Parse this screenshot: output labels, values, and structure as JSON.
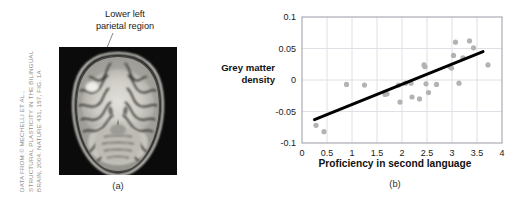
{
  "figure": {
    "panel_a": {
      "caption": "(a)",
      "callout_label_line1": "Lower left",
      "callout_label_line2": "parietal region",
      "image_description": "coronal-mri-brain-scan"
    },
    "panel_b": {
      "caption": "(b)"
    },
    "credit": {
      "line1": "DATA FROM © MECHELLI ET AL.,",
      "line2": "STRUCTURAL PLASTICITY IN THE BILINGUAL",
      "line3": "BRAIN, 2004. NATURE 431, 157, FIG. 1A",
      "color": "#8d8d8d"
    }
  },
  "colors": {
    "point": "#b3b3b3",
    "trendline": "#000000",
    "grid": "#dcdce4",
    "frame": "#9a9aa5",
    "text": "#1a1a1a"
  },
  "chart_data": {
    "type": "scatter",
    "title": "",
    "xlabel": "Proficiency in second language",
    "ylabel": "Grey matter density",
    "xlim": [
      0,
      4
    ],
    "ylim": [
      -0.1,
      0.1
    ],
    "xticks": [
      "0",
      "0.5",
      "1",
      "1.5",
      "2",
      "2.5",
      "3",
      "3.5",
      "4"
    ],
    "xtick_values": [
      0,
      0.5,
      1,
      1.5,
      2,
      2.5,
      3,
      3.5,
      4
    ],
    "yticks": [
      "0.1",
      "0.05",
      "0",
      "-0.05",
      "-0.1"
    ],
    "ytick_values": [
      0.1,
      0.05,
      0,
      -0.05,
      -0.1
    ],
    "grid": true,
    "legend": "none",
    "points": [
      [
        0.28,
        -0.072
      ],
      [
        0.44,
        -0.082
      ],
      [
        0.89,
        -0.007
      ],
      [
        1.25,
        -0.008
      ],
      [
        1.66,
        -0.023
      ],
      [
        1.7,
        -0.022
      ],
      [
        1.93,
        -0.008
      ],
      [
        1.96,
        -0.035
      ],
      [
        2.07,
        -0.005
      ],
      [
        2.18,
        -0.005
      ],
      [
        2.2,
        -0.027
      ],
      [
        2.35,
        -0.03
      ],
      [
        2.44,
        0.024
      ],
      [
        2.46,
        0.021
      ],
      [
        2.48,
        -0.006
      ],
      [
        2.53,
        -0.02
      ],
      [
        2.69,
        -0.007
      ],
      [
        2.96,
        0.021
      ],
      [
        2.99,
        0.019
      ],
      [
        3.03,
        0.039
      ],
      [
        3.07,
        0.06
      ],
      [
        3.14,
        -0.005
      ],
      [
        3.22,
        0.035
      ],
      [
        3.35,
        0.062
      ],
      [
        3.43,
        0.051
      ],
      [
        3.72,
        0.024
      ]
    ],
    "trendline": {
      "type": "linear",
      "x_start": 0.25,
      "y_start": -0.063,
      "x_end": 3.62,
      "y_end": 0.045
    }
  }
}
